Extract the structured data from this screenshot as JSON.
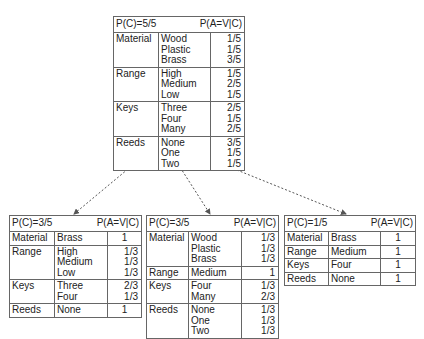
{
  "root": {
    "prior": "P(C)=5/5",
    "cond": "P(A=V|C)",
    "groups": [
      {
        "attr": "Material",
        "values": [
          "Wood",
          "Plastic",
          "Brass"
        ],
        "probs": [
          "1/5",
          "1/5",
          "3/5"
        ]
      },
      {
        "attr": "Range",
        "values": [
          "High",
          "Medium",
          "Low"
        ],
        "probs": [
          "1/5",
          "2/5",
          "1/5"
        ]
      },
      {
        "attr": "Keys",
        "values": [
          "Three",
          "Four",
          "Many"
        ],
        "probs": [
          "2/5",
          "1/5",
          "2/5"
        ]
      },
      {
        "attr": "Reeds",
        "values": [
          "None",
          "One",
          "Two"
        ],
        "probs": [
          "3/5",
          "1/5",
          "1/5"
        ]
      }
    ]
  },
  "left": {
    "prior": "P(C)=3/5",
    "cond": "P(A=V|C)",
    "groups": [
      {
        "attr": "Material",
        "values": [
          "Brass"
        ],
        "probs": [
          "1"
        ]
      },
      {
        "attr": "Range",
        "values": [
          "High",
          "Medium",
          "Low"
        ],
        "probs": [
          "1/3",
          "1/3",
          "1/3"
        ]
      },
      {
        "attr": "Keys",
        "values": [
          "Three",
          "Four"
        ],
        "probs": [
          "2/3",
          "1/3"
        ]
      },
      {
        "attr": "Reeds",
        "values": [
          "None"
        ],
        "probs": [
          "1"
        ]
      }
    ]
  },
  "middle": {
    "prior": "P(C)=3/5",
    "cond": "P(A=V|C)",
    "groups": [
      {
        "attr": "Material",
        "values": [
          "Wood",
          "Plastic",
          "Brass"
        ],
        "probs": [
          "1/3",
          "1/3",
          "1/3"
        ]
      },
      {
        "attr": "Range",
        "values": [
          "Medium"
        ],
        "probs": [
          "1"
        ]
      },
      {
        "attr": "Keys",
        "values": [
          "Four",
          "Many"
        ],
        "probs": [
          "1/3",
          "2/3"
        ]
      },
      {
        "attr": "Reeds",
        "values": [
          "None",
          "One",
          "Two"
        ],
        "probs": [
          "1/3",
          "1/3",
          "1/3"
        ]
      }
    ]
  },
  "right": {
    "prior": "P(C)=1/5",
    "cond": "P(A=V|C)",
    "groups": [
      {
        "attr": "Material",
        "values": [
          "Brass"
        ],
        "probs": [
          "1"
        ]
      },
      {
        "attr": "Range",
        "values": [
          "Medium"
        ],
        "probs": [
          "1"
        ]
      },
      {
        "attr": "Keys",
        "values": [
          "Four"
        ],
        "probs": [
          "1"
        ]
      },
      {
        "attr": "Reeds",
        "values": [
          "None"
        ],
        "probs": [
          "1"
        ]
      }
    ]
  },
  "colors": {
    "line": "#666666",
    "arrow": "#555555",
    "text": "#222222"
  }
}
